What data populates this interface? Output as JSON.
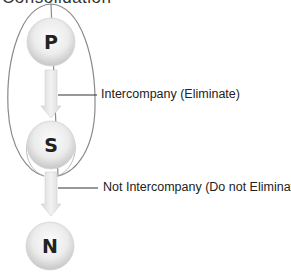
{
  "title": "Consolidation",
  "nodes": [
    {
      "id": "P",
      "label": "P"
    },
    {
      "id": "S",
      "label": "S"
    },
    {
      "id": "N",
      "label": "N"
    }
  ],
  "edges": [
    {
      "from": "P",
      "to": "S",
      "label": "Intercompany (Eliminate)"
    },
    {
      "from": "S",
      "to": "N",
      "label": "Not Intercompany (Do not Eliminate)"
    }
  ],
  "colors": {
    "outline": "#8a8a8a",
    "node_fill_light": "#fafafa",
    "node_fill_dark": "#c8c8c8",
    "arrow_fill": "#e6e6e6",
    "connector": "#333333"
  }
}
